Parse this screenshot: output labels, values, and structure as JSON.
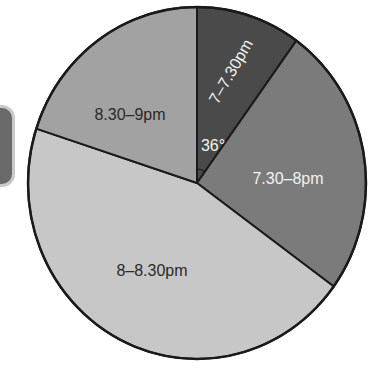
{
  "chart_data": {
    "type": "pie",
    "title": "",
    "start_angle_deg_from_top": 0,
    "direction": "clockwise",
    "categories": [
      "7–7.30pm",
      "7.30–8pm",
      "8–8.30pm",
      "8.30–9pm"
    ],
    "values": [
      36,
      90,
      162,
      72
    ],
    "unit": "degrees",
    "annotations": [
      {
        "text": "36°",
        "slice": "7–7.30pm",
        "meaning": "angle of sector"
      }
    ],
    "legend": "none (labels inside slices)"
  },
  "slices": [
    {
      "label": "7–7.30pm",
      "degrees": 36,
      "color": "#4a4a4a",
      "text_color": "#f2f2f2",
      "label_x": 232,
      "label_y": 72,
      "label_rotate": -60
    },
    {
      "label": "7.30–8pm",
      "degrees": 90,
      "color": "#7b7b7b",
      "text_color": "#f2f2f2",
      "label_x": 288,
      "label_y": 180,
      "label_rotate": 0
    },
    {
      "label": "8–8.30pm",
      "degrees": 162,
      "color": "#c7c7c7",
      "text_color": "#2a2a2a",
      "label_x": 152,
      "label_y": 272,
      "label_rotate": 0
    },
    {
      "label": "8.30–9pm",
      "degrees": 72,
      "color": "#a2a2a2",
      "text_color": "#2a2a2a",
      "label_x": 130,
      "label_y": 116,
      "label_rotate": 0
    }
  ],
  "angle_marker": {
    "text": "36°",
    "x": 213,
    "y": 147,
    "color": "#f2f2f2"
  },
  "geometry": {
    "cx": 197,
    "cy": 183,
    "rx": 169,
    "ry": 176
  }
}
